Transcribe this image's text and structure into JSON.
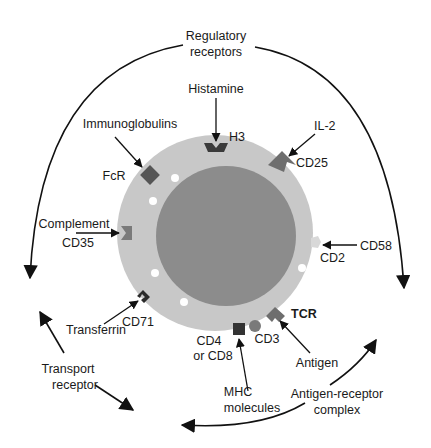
{
  "title_group": {
    "regulatory": [
      "Regulatory",
      "receptors"
    ],
    "transport": [
      "Transport",
      "receptor"
    ],
    "antigen_complex": [
      "Antigen-receptor",
      "complex"
    ]
  },
  "ligands": {
    "histamine": "Histamine",
    "il2": "IL-2",
    "immunoglobulins": "Immunoglobulins",
    "complement": "Complement",
    "cd58": "CD58",
    "transferrin": "Transferrin",
    "mhc": [
      "MHC",
      "molecules"
    ],
    "antigen": "Antigen"
  },
  "receptors": {
    "h3": "H3",
    "cd25": "CD25",
    "fcr": "FcR",
    "cd35": "CD35",
    "cd2": "CD2",
    "cd71": "CD71",
    "cd4_cd8": [
      "CD4",
      "or CD8"
    ],
    "cd3": "CD3",
    "tcr": "TCR"
  },
  "colors": {
    "membrane": "#c8c8c8",
    "nucleus": "#8c8c8c",
    "receptor_dark": "#3a3a3a",
    "receptor_mid": "#6e6e6e",
    "receptor_light": "#a0a0a0",
    "vesicle": "#ffffff",
    "ink": "#111111"
  }
}
